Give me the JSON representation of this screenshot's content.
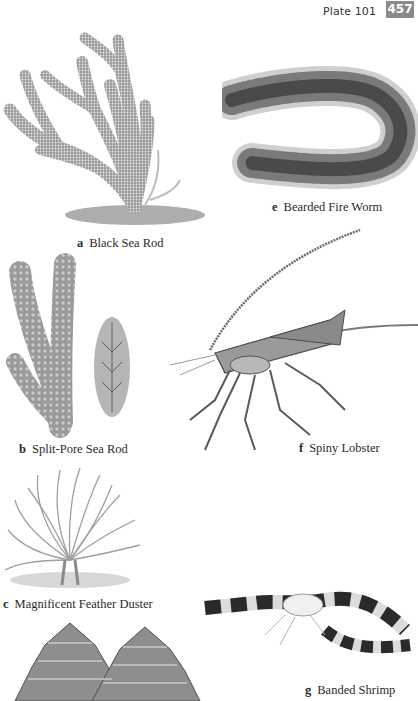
{
  "header": {
    "plate_label": "Plate 101",
    "page_number": "457",
    "badge_color": "#8a8a8a"
  },
  "species": [
    {
      "letter": "a",
      "name": "Black Sea Rod"
    },
    {
      "letter": "b",
      "name": "Split-Pore Sea Rod"
    },
    {
      "letter": "c",
      "name": "Magnificent Feather Duster"
    },
    {
      "letter": "d",
      "name": ""
    },
    {
      "letter": "e",
      "name": "Bearded Fire Worm"
    },
    {
      "letter": "f",
      "name": "Spiny Lobster"
    },
    {
      "letter": "g",
      "name": "Banded Shrimp"
    }
  ],
  "illustrations": {
    "a": "black-sea-rod-illustration",
    "b": "split-pore-sea-rod-illustration",
    "c": "magnificent-feather-duster-illustration",
    "d": "christmas-tree-worm-illustration",
    "e": "bearded-fire-worm-illustration",
    "f": "spiny-lobster-illustration",
    "g": "banded-shrimp-illustration"
  }
}
